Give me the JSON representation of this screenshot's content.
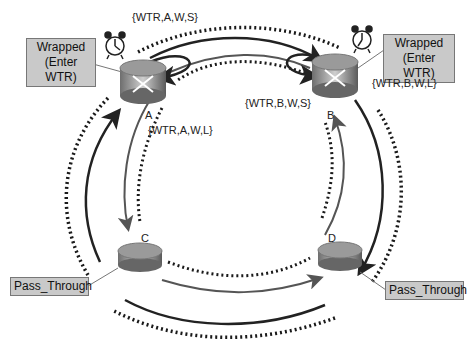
{
  "nodes": [
    {
      "id": "A",
      "label": "A",
      "state": "Wrapped\n(Enter WTR)",
      "state_line1": "Wrapped",
      "state_line2": "(Enter WTR)",
      "has_timer": true
    },
    {
      "id": "B",
      "label": "B",
      "state_line1": "Wrapped",
      "state_line2": "(Enter WTR)",
      "has_timer": true
    },
    {
      "id": "C",
      "label": "C",
      "state_line1": "Pass_Through",
      "has_timer": false
    },
    {
      "id": "D",
      "label": "D",
      "state_line1": "Pass_Through",
      "has_timer": false
    }
  ],
  "messages": {
    "a_short": "{WTR,A,W,S}",
    "a_long": "{WTR,A,W,L}",
    "b_short": "{WTR,B,W,S}",
    "b_long": "{WTR,B,W,L}"
  },
  "colors": {
    "outer_ring": "#222222",
    "inner_ring": "#555555",
    "dotted": "#1a1a1a",
    "label_box": "#c9c9c9"
  }
}
